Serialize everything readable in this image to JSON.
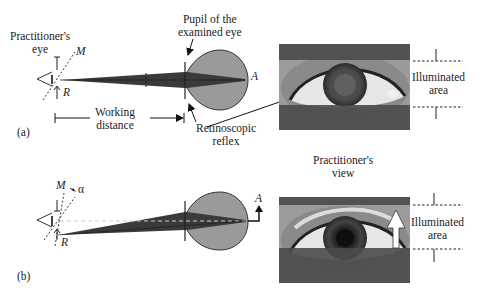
{
  "panel_a": {
    "tag": "(a)",
    "practitioner_eye_label_1": "Practitioner's",
    "practitioner_eye_label_2": "eye",
    "mirror_label": "M",
    "retinoscope_label": "R",
    "pupil_label_1": "Pupil of the",
    "pupil_label_2": "examined eye",
    "point_label": "A",
    "working_distance_1": "Working",
    "working_distance_2": "distance",
    "reflex_label_1": "Retinoscopic",
    "reflex_label_2": "reflex",
    "illuminated_1": "Illuminated",
    "illuminated_2": "area"
  },
  "panel_b": {
    "tag": "(b)",
    "mirror_label": "M",
    "angle_label": "α",
    "retinoscope_label": "R",
    "point_label": "A",
    "view_label_1": "Practitioner's",
    "view_label_2": "view",
    "illuminated_1": "Illuminated",
    "illuminated_2": "area"
  },
  "colors": {
    "beam": "#3a3a3a",
    "globe": "#9a9a9a",
    "band_dark": "#4a4a4a",
    "band_light": "#9b9b9b"
  }
}
